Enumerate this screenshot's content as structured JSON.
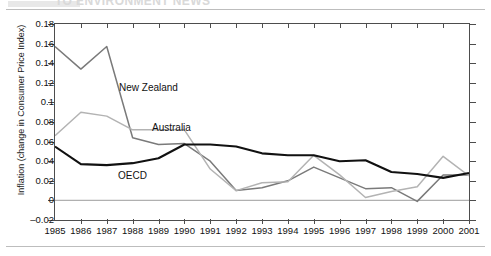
{
  "header": {
    "clipped_text": "TO ENVIRONMENT NEWS",
    "visible": true
  },
  "chart_data": {
    "type": "line",
    "title": "",
    "xlabel": "",
    "ylabel": "Inflation (change in Consumer Price Index)",
    "x": [
      1985,
      1986,
      1987,
      1988,
      1989,
      1990,
      1991,
      1992,
      1993,
      1994,
      1995,
      1996,
      1997,
      1998,
      1999,
      2000,
      2001
    ],
    "xticklabels": [
      "1985",
      "1986",
      "1987",
      "1988",
      "1989",
      "1990",
      "1991",
      "1992",
      "1993",
      "1994",
      "1995",
      "1996",
      "1997",
      "1998",
      "1999",
      "2000",
      "2001"
    ],
    "yticklabels": [
      "0.18",
      "0.16",
      "0.14",
      "0.12",
      "0.1",
      "0.08",
      "0.06",
      "0.04",
      "0.02",
      "0",
      "-0.02"
    ],
    "ytickvalues": [
      0.18,
      0.16,
      0.14,
      0.12,
      0.1,
      0.08,
      0.06,
      0.04,
      0.02,
      0,
      -0.02
    ],
    "ylim": [
      -0.02,
      0.18
    ],
    "xlim": [
      1985,
      2001
    ],
    "grid": false,
    "zero_line": true,
    "legend": "inline-annotations",
    "series": [
      {
        "name": "New Zealand",
        "color": "#7a7a7a",
        "values": [
          0.157,
          0.134,
          0.157,
          0.064,
          0.057,
          0.058,
          0.04,
          0.01,
          0.013,
          0.02,
          0.034,
          0.023,
          0.012,
          0.013,
          -0.001,
          0.026,
          0.026
        ]
      },
      {
        "name": "Australia",
        "color": "#b3b3b3",
        "values": [
          0.066,
          0.09,
          0.086,
          0.072,
          0.072,
          0.072,
          0.032,
          0.01,
          0.018,
          0.019,
          0.046,
          0.026,
          0.003,
          0.009,
          0.014,
          0.045,
          0.025
        ]
      },
      {
        "name": "OECD",
        "color": "#111111",
        "values": [
          0.055,
          0.037,
          0.036,
          0.038,
          0.043,
          0.057,
          0.057,
          0.055,
          0.048,
          0.046,
          0.046,
          0.04,
          0.041,
          0.029,
          0.027,
          0.023,
          0.028
        ]
      }
    ],
    "annotations": [
      {
        "label": "New Zealand",
        "x_px": 119,
        "y_px": 82
      },
      {
        "label": "Australia",
        "x_px": 152,
        "y_px": 122
      },
      {
        "label": "OECD",
        "x_px": 118,
        "y_px": 170
      }
    ]
  }
}
